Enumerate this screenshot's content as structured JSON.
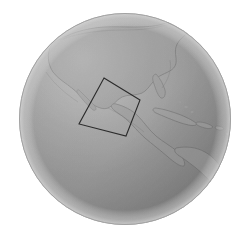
{
  "scene": {
    "title": "Earth globe view",
    "background_color": "#ffffff",
    "render_style": "grayscale shaded sphere",
    "view_center_description": "Gulf of Mexico / Caribbean"
  },
  "globe": {
    "name": "earth-globe",
    "center_x": 125,
    "center_y": 119,
    "radius": 106,
    "ocean_color": "#8f8f8f",
    "land_color": "#9e9e9e",
    "limb_highlight_color": "#cfcfcf",
    "terminator_shadow_color": "#6e6e6e",
    "coastline_color": "#6f6f6f"
  },
  "roi_box": {
    "name": "region-of-interest-box",
    "label": "",
    "stroke_color": "#2b2b2b",
    "stroke_width": 1,
    "fill": "none",
    "rotation_degrees": -18,
    "corners": [
      {
        "x": 104,
        "y": 78
      },
      {
        "x": 140,
        "y": 100
      },
      {
        "x": 126,
        "y": 136
      },
      {
        "x": 79,
        "y": 124
      }
    ]
  },
  "landmasses": [
    {
      "name": "north-america",
      "label": "North America"
    },
    {
      "name": "central-america",
      "label": "Central America"
    },
    {
      "name": "south-america",
      "label": "South America"
    },
    {
      "name": "cuba",
      "label": "Cuba"
    },
    {
      "name": "hispaniola",
      "label": "Hispaniola"
    },
    {
      "name": "puerto-rico",
      "label": "Puerto Rico"
    },
    {
      "name": "lesser-antilles",
      "label": "Lesser Antilles"
    },
    {
      "name": "florida-peninsula",
      "label": "Florida"
    },
    {
      "name": "yucatan-peninsula",
      "label": "Yucatán"
    },
    {
      "name": "baja-california",
      "label": "Baja California"
    }
  ]
}
